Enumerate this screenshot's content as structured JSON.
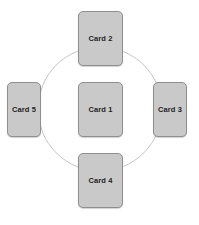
{
  "diagram": {
    "background_color": "#ffffff",
    "card_fill_color": "#c9c9c9",
    "card_border_color": "#8f8f8f",
    "card_label_color": "#1f1f1f",
    "circle": {
      "stroke_color": "#c4c4c4",
      "stroke_width": 1,
      "center_x": 100,
      "center_y": 109,
      "radius": 62
    },
    "cards": [
      {
        "id": "card-center",
        "label": "Card 1",
        "position": "center"
      },
      {
        "id": "card-top",
        "label": "Card 2",
        "position": "top"
      },
      {
        "id": "card-right",
        "label": "Card 3",
        "position": "right"
      },
      {
        "id": "card-bottom",
        "label": "Card 4",
        "position": "bottom"
      },
      {
        "id": "card-left",
        "label": "Card 5",
        "position": "left"
      }
    ]
  }
}
